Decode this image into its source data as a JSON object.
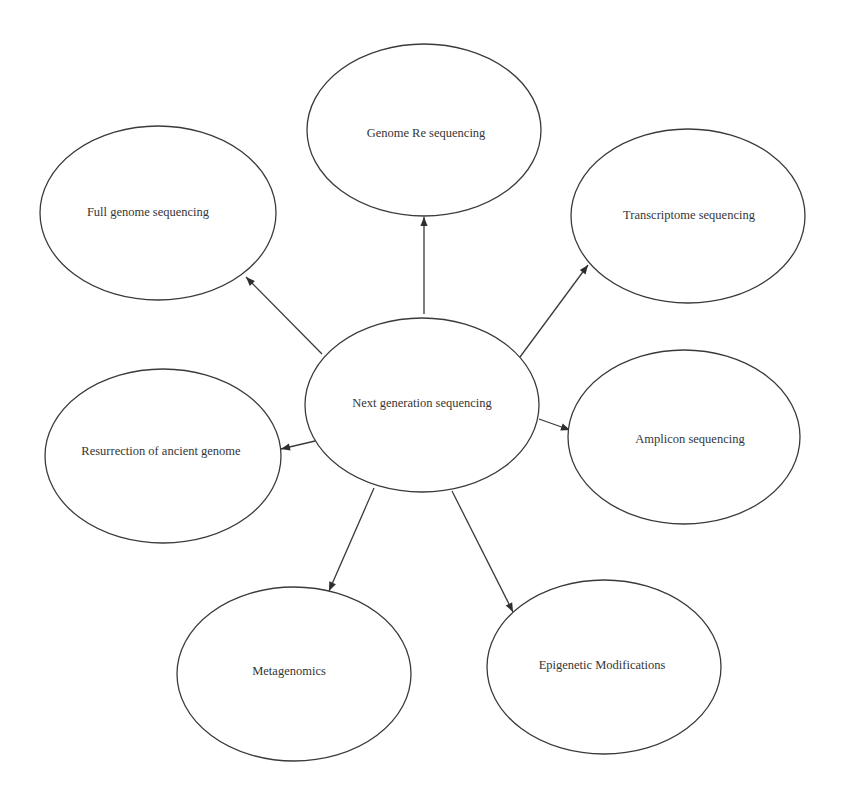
{
  "diagram": {
    "type": "hub-and-spoke",
    "center": {
      "id": "ngs",
      "label": "Next generation sequencing",
      "ellipse": {
        "cx": 422,
        "cy": 405,
        "rx": 117,
        "ry": 87
      },
      "label_pos": {
        "x": 422,
        "y": 404
      }
    },
    "nodes": [
      {
        "id": "genome-resequencing",
        "label": "Genome Re sequencing",
        "ellipse": {
          "cx": 424,
          "cy": 130,
          "rx": 117,
          "ry": 86
        },
        "label_pos": {
          "x": 426,
          "y": 134
        }
      },
      {
        "id": "full-genome-sequencing",
        "label": "Full genome sequencing",
        "ellipse": {
          "cx": 158,
          "cy": 213,
          "rx": 118,
          "ry": 87
        },
        "label_pos": {
          "x": 148,
          "y": 213
        }
      },
      {
        "id": "transcriptome-sequencing",
        "label": "Transcriptome sequencing",
        "ellipse": {
          "cx": 688,
          "cy": 216,
          "rx": 117,
          "ry": 87
        },
        "label_pos": {
          "x": 689,
          "y": 216
        }
      },
      {
        "id": "resurrection-ancient-genome",
        "label": "Resurrection of ancient genome",
        "ellipse": {
          "cx": 163,
          "cy": 456,
          "rx": 118,
          "ry": 87
        },
        "label_pos": {
          "x": 161,
          "y": 452
        }
      },
      {
        "id": "amplicon-sequencing",
        "label": "Amplicon sequencing",
        "ellipse": {
          "cx": 684,
          "cy": 437,
          "rx": 116,
          "ry": 87
        },
        "label_pos": {
          "x": 690,
          "y": 440
        }
      },
      {
        "id": "metagenomics",
        "label": "Metagenomics",
        "ellipse": {
          "cx": 294,
          "cy": 674,
          "rx": 117,
          "ry": 87
        },
        "label_pos": {
          "x": 289,
          "y": 672
        }
      },
      {
        "id": "epigenetic-modifications",
        "label": "Epigenetic Modifications",
        "ellipse": {
          "cx": 604,
          "cy": 667,
          "rx": 117,
          "ry": 87
        },
        "label_pos": {
          "x": 602,
          "y": 666
        }
      }
    ],
    "edges": [
      {
        "from": "ngs",
        "to": "genome-resequencing",
        "x1": 424,
        "y1": 314,
        "x2": 424,
        "y2": 217
      },
      {
        "from": "ngs",
        "to": "full-genome-sequencing",
        "x1": 322,
        "y1": 354,
        "x2": 246,
        "y2": 277
      },
      {
        "from": "ngs",
        "to": "transcriptome-sequencing",
        "x1": 520,
        "y1": 357,
        "x2": 588,
        "y2": 265
      },
      {
        "from": "ngs",
        "to": "resurrection-ancient-genome",
        "x1": 315,
        "y1": 441,
        "x2": 281,
        "y2": 449
      },
      {
        "from": "ngs",
        "to": "amplicon-sequencing",
        "x1": 539,
        "y1": 419,
        "x2": 570,
        "y2": 430
      },
      {
        "from": "ngs",
        "to": "metagenomics",
        "x1": 374,
        "y1": 488,
        "x2": 329,
        "y2": 591
      },
      {
        "from": "ngs",
        "to": "epigenetic-modifications",
        "x1": 452,
        "y1": 491,
        "x2": 513,
        "y2": 612
      }
    ],
    "colors": {
      "stroke": "#3a3a3a",
      "text": "#353535",
      "background": "#ffffff"
    }
  }
}
